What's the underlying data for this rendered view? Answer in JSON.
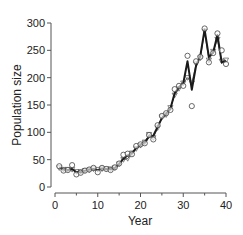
{
  "chart_data": {
    "type": "line",
    "title": "",
    "xlabel": "Year",
    "ylabel": "Population size",
    "xlim": [
      0,
      40
    ],
    "ylim": [
      0,
      300
    ],
    "x_ticks": [
      0,
      10,
      20,
      30,
      40
    ],
    "x_minor_ticks": [
      5,
      15,
      25,
      35
    ],
    "y_ticks": [
      0,
      50,
      100,
      150,
      200,
      250,
      300
    ],
    "grid": false,
    "legend": null,
    "x": [
      1,
      2,
      3,
      4,
      5,
      6,
      7,
      8,
      9,
      10,
      11,
      12,
      13,
      14,
      15,
      16,
      17,
      18,
      19,
      20,
      21,
      22,
      23,
      24,
      25,
      26,
      27,
      28,
      29,
      30,
      31,
      32,
      33,
      34,
      35,
      36,
      37,
      38,
      39,
      40
    ],
    "series": [
      {
        "name": "Observed",
        "style": "open-circles",
        "values": [
          38,
          30,
          31,
          40,
          23,
          26,
          30,
          32,
          35,
          27,
          35,
          33,
          31,
          36,
          43,
          59,
          61,
          60,
          75,
          78,
          80,
          95,
          87,
          113,
          130,
          135,
          141,
          179,
          185,
          185,
          240,
          148,
          230,
          238,
          290,
          228,
          245,
          281,
          250,
          225
        ]
      },
      {
        "name": "Model fit (thick line)",
        "style": "thick-line",
        "values": [
          36,
          32,
          31,
          33,
          27,
          27,
          30,
          32,
          33,
          31,
          34,
          33,
          33,
          35,
          42,
          52,
          58,
          62,
          71,
          77,
          82,
          92,
          94,
          110,
          126,
          134,
          143,
          172,
          183,
          190,
          230,
          178,
          222,
          240,
          288,
          238,
          246,
          278,
          228,
          230
        ]
      },
      {
        "name": "Model prediction (thin line, triangles)",
        "style": "thin-line-triangles",
        "values": [
          35,
          32,
          32,
          32,
          28,
          28,
          30,
          31,
          33,
          32,
          33,
          33,
          33,
          35,
          42,
          50,
          52,
          62,
          70,
          76,
          82,
          96,
          90,
          108,
          128,
          132,
          145,
          168,
          180,
          190,
          200,
          190,
          225,
          236,
          285,
          232,
          248,
          270,
          230,
          232
        ]
      }
    ]
  }
}
